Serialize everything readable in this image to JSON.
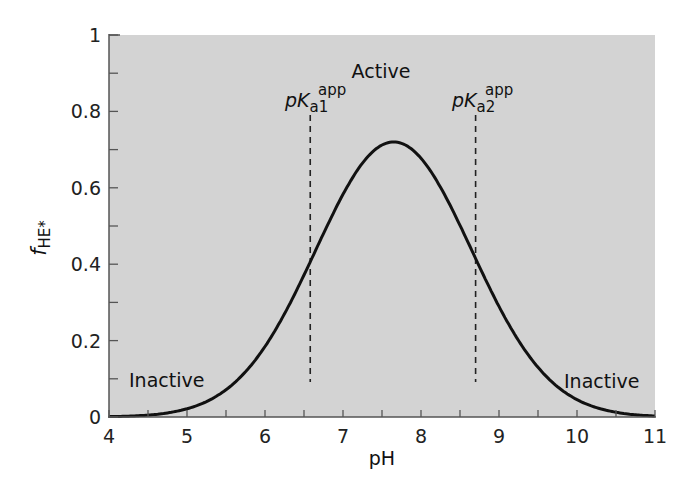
{
  "chart_data": {
    "type": "line",
    "title": "",
    "xlabel": "pH",
    "ylabel": "f_HE*",
    "ylabel_main": "f",
    "ylabel_sub": "HE*",
    "xlim": [
      4,
      11
    ],
    "ylim": [
      0,
      1
    ],
    "grid": false,
    "legend": null,
    "x_ticks": [
      4,
      5,
      6,
      7,
      8,
      9,
      10,
      11
    ],
    "x_tick_labels": [
      "4",
      "5",
      "6",
      "7",
      "8",
      "9",
      "10",
      "11"
    ],
    "y_ticks": [
      0,
      0.2,
      0.4,
      0.6,
      0.8,
      1
    ],
    "y_tick_labels": [
      "0",
      "0.2",
      "0.4",
      "0.6",
      "0.8",
      "1"
    ],
    "series": [
      {
        "name": "f_HE*",
        "x": [
          4.0,
          4.5,
          5.0,
          5.5,
          6.0,
          6.5,
          7.0,
          7.5,
          7.65,
          8.0,
          8.5,
          9.0,
          9.5,
          10.0,
          10.5,
          11.0
        ],
        "y": [
          0.0,
          0.005,
          0.02,
          0.07,
          0.18,
          0.38,
          0.58,
          0.71,
          0.72,
          0.69,
          0.52,
          0.29,
          0.13,
          0.04,
          0.01,
          0.0
        ]
      }
    ],
    "reference_lines": [
      {
        "label_main": "pK",
        "label_sub": "a1",
        "label_sup": "app",
        "x": 6.58,
        "style": "dashed"
      },
      {
        "label_main": "pK",
        "label_sub": "a2",
        "label_sup": "app",
        "x": 8.7,
        "style": "dashed"
      }
    ],
    "annotations": [
      {
        "text": "Active",
        "x": 7.65,
        "y": 0.96
      },
      {
        "text": "Inactive",
        "x": 4.8,
        "y": 0.1
      },
      {
        "text": "Inactive",
        "x": 10.1,
        "y": 0.1
      }
    ],
    "peak": {
      "x": 7.65,
      "y": 0.72
    }
  },
  "labels": {
    "active": "Active",
    "inactive_left": "Inactive",
    "inactive_right": "Inactive",
    "pk1_p": "p",
    "pk1_k": "K",
    "pk1_sub": "a1",
    "pk1_sup": "app",
    "pk2_p": "p",
    "pk2_k": "K",
    "pk2_sub": "a2",
    "pk2_sup": "app",
    "xlabel": "pH",
    "ylabel_main": "f",
    "ylabel_sub": "HE*"
  },
  "colors": {
    "plot_bg": "#d3d3d3",
    "curve": "#111111",
    "axis": "#555555"
  }
}
